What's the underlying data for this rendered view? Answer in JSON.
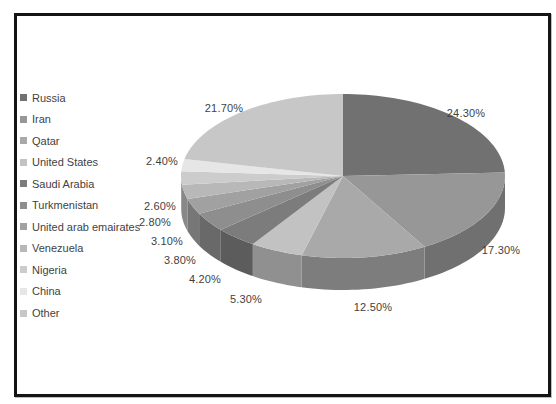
{
  "chart_data": {
    "type": "pie",
    "style": "3d",
    "title": "",
    "legend_position": "left",
    "label_color": "#3f3f3f",
    "legend_text_color": "#3f3f3f",
    "frame_border_color": "#141414",
    "background_color": "#ffffff",
    "slices": [
      {
        "name": "Russia",
        "value": 24.3,
        "pct_label": "24.30%",
        "color": "#717171"
      },
      {
        "name": "Iran",
        "value": 17.3,
        "pct_label": "17.30%",
        "color": "#979797"
      },
      {
        "name": "Qatar",
        "value": 12.5,
        "pct_label": "12.50%",
        "color": "#a9a9a9"
      },
      {
        "name": "United States",
        "value": 5.3,
        "pct_label": "5.30%",
        "color": "#c2c2c2"
      },
      {
        "name": "Saudi Arabia",
        "value": 4.2,
        "pct_label": "4.20%",
        "color": "#7c7c7c"
      },
      {
        "name": "Turkmenistan",
        "value": 3.8,
        "pct_label": "3.80%",
        "color": "#8e8e8e"
      },
      {
        "name": "United arab emairates",
        "value": 3.1,
        "pct_label": "3.10%",
        "color": "#a1a1a1"
      },
      {
        "name": "Venezuela",
        "value": 2.8,
        "pct_label": "2.80%",
        "color": "#b8b8b8"
      },
      {
        "name": "Nigeria",
        "value": 2.6,
        "pct_label": "2.60%",
        "color": "#cccccc"
      },
      {
        "name": "China",
        "value": 2.4,
        "pct_label": "2.40%",
        "color": "#e6e6e6"
      },
      {
        "name": "Other",
        "value": 21.7,
        "pct_label": "21.70%",
        "color": "#c7c7c7"
      }
    ]
  }
}
